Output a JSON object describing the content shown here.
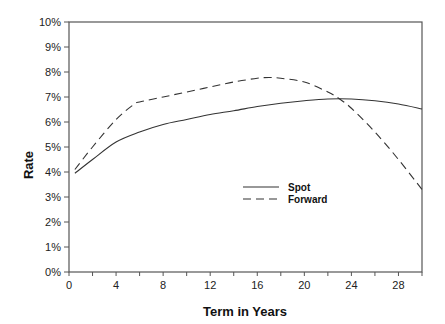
{
  "chart_data": {
    "type": "line",
    "title": "",
    "xlabel": "Term in Years",
    "ylabel": "Rate",
    "xlim": [
      0,
      30
    ],
    "ylim": [
      0,
      10
    ],
    "x_ticks": [
      0,
      4,
      8,
      12,
      16,
      20,
      24,
      28
    ],
    "x_minor_step": 2,
    "y_ticks": [
      "0%",
      "1%",
      "2%",
      "3%",
      "4%",
      "5%",
      "6%",
      "7%",
      "8%",
      "9%",
      "10%"
    ],
    "grid": false,
    "legend_position": "center-right inside plot",
    "series": [
      {
        "name": "Spot",
        "style": "solid",
        "x": [
          0.5,
          2,
          4,
          6,
          8,
          10,
          12,
          14,
          16,
          18,
          20,
          22,
          24,
          26,
          28,
          30
        ],
        "values": [
          3.95,
          4.5,
          5.2,
          5.6,
          5.9,
          6.1,
          6.3,
          6.45,
          6.62,
          6.75,
          6.85,
          6.92,
          6.92,
          6.85,
          6.72,
          6.52
        ]
      },
      {
        "name": "Forward",
        "style": "dashed",
        "x": [
          0.5,
          2,
          4,
          5.5,
          6,
          8,
          10,
          12,
          14,
          16,
          17,
          18,
          20,
          22,
          23,
          24,
          26,
          28,
          30
        ],
        "values": [
          4.1,
          5.0,
          6.1,
          6.7,
          6.8,
          7.0,
          7.2,
          7.4,
          7.6,
          7.75,
          7.78,
          7.75,
          7.6,
          7.2,
          6.92,
          6.55,
          5.6,
          4.5,
          3.3
        ]
      }
    ]
  }
}
